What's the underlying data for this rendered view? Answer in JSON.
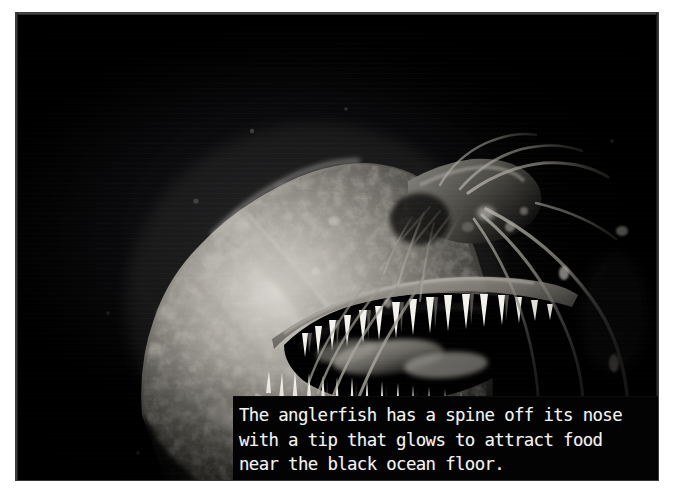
{
  "page": {
    "background_color": "#ffffff",
    "media_type": "photograph-with-caption"
  },
  "photo": {
    "alt_description": "Black and white photograph of a deep-sea anglerfish head in profile with its mouth open, showing long needle-like teeth and thin barbel filaments extending from its snout",
    "subject": "anglerfish",
    "palette": "monochrome",
    "background_color": "#000000",
    "highlight_color": "#f0efe9",
    "midtone_color": "#8d8b86",
    "shadow_color": "#0a0a0c"
  },
  "caption": {
    "background_color": "#030303",
    "text_color": "#f2f2f0",
    "lines": [
      "The anglerfish has a spine off its nose",
      "with a tip that glows to attract food",
      "near the black ocean floor."
    ],
    "text": "The anglerfish has a spine off its nose\nwith a tip that glows to attract food\nnear the black ocean floor."
  }
}
